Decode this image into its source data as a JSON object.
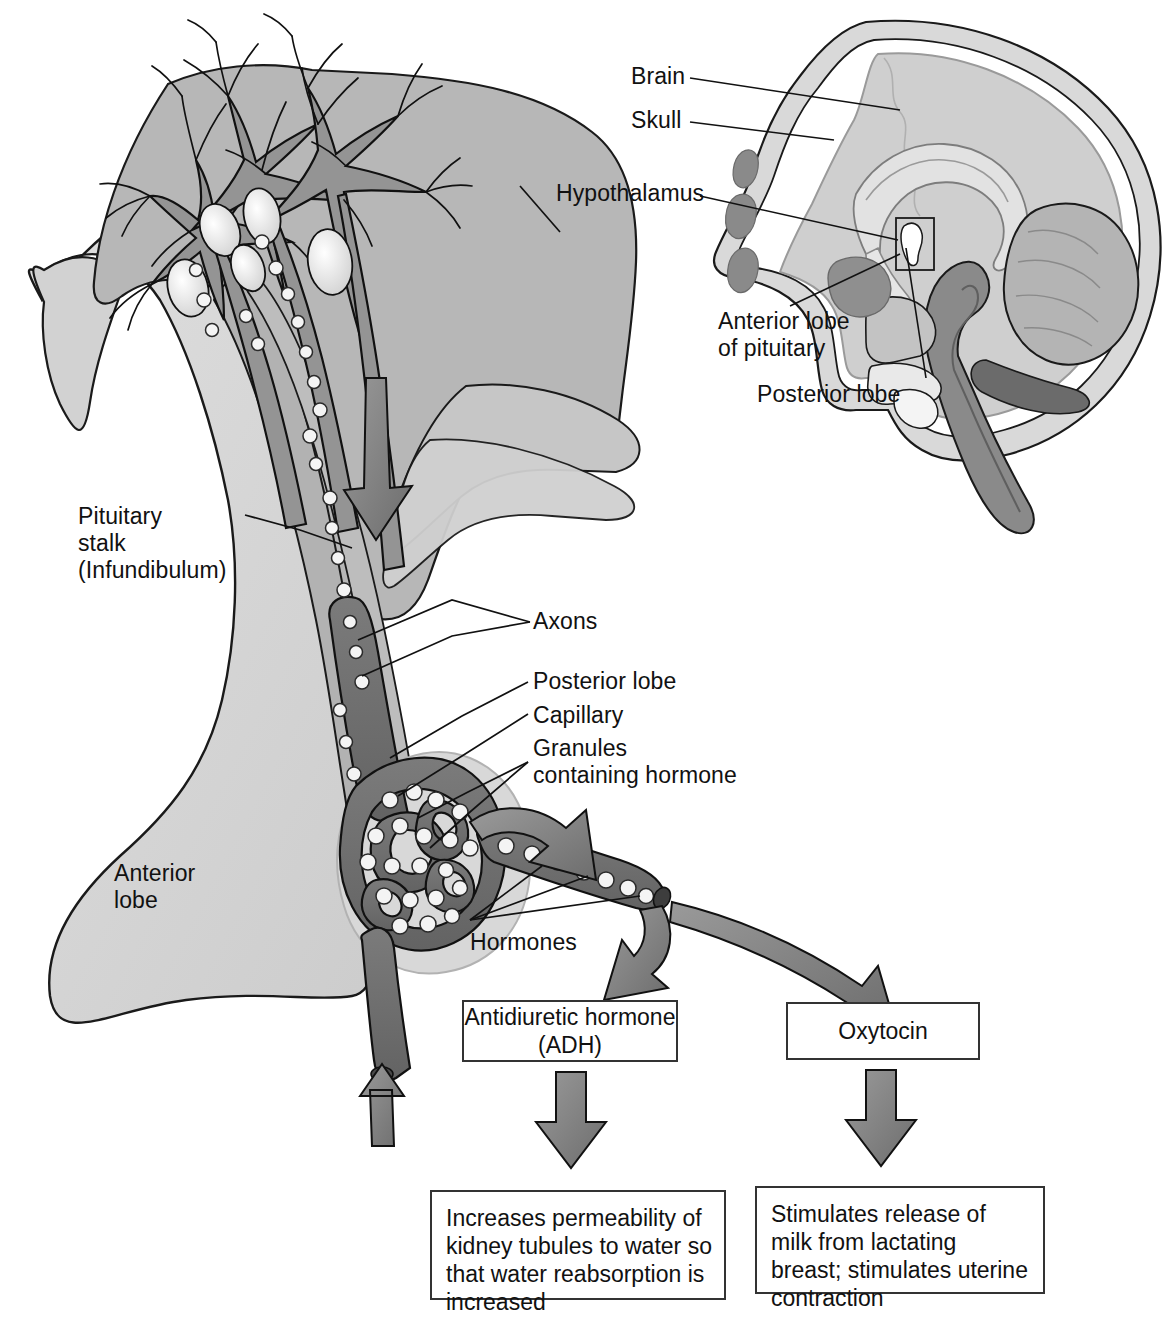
{
  "figure": {
    "type": "anatomical-diagram"
  },
  "inset": {
    "name": "midsagittal-head-section",
    "labels": [
      {
        "id": "brain",
        "text": "Brain"
      },
      {
        "id": "skull",
        "text": "Skull"
      },
      {
        "id": "hypothalamus",
        "text": "Hypothalamus"
      },
      {
        "id": "anterior-lobe",
        "text": "Anterior lobe\nof pituitary"
      },
      {
        "id": "posterior-lobe",
        "text": "Posterior lobe"
      }
    ]
  },
  "main": {
    "name": "posterior-pituitary-detail",
    "labels": [
      {
        "id": "pituitary-stalk",
        "text": "Pituitary\nstalk\n(Infundibulum)"
      },
      {
        "id": "axons",
        "text": "Axons"
      },
      {
        "id": "posterior-lobe",
        "text": "Posterior lobe"
      },
      {
        "id": "capillary",
        "text": "Capillary"
      },
      {
        "id": "granules",
        "text": "Granules\ncontaining hormone"
      },
      {
        "id": "anterior-lobe",
        "text": "Anterior\nlobe"
      },
      {
        "id": "hormones",
        "text": "Hormones"
      }
    ]
  },
  "hormone_boxes": [
    {
      "id": "adh",
      "label": "Antidiuretic\nhormone (ADH)"
    },
    {
      "id": "oxytocin",
      "label": "Oxytocin"
    }
  ],
  "effect_boxes": [
    {
      "id": "adh-effect",
      "label": "Increases permeability of\nkidney tubules to water\nso that water reabsorption\nis increased"
    },
    {
      "id": "oxytocin-effect",
      "label": "Stimulates release of milk\nfrom lactating breast;\nstimulates uterine\ncontraction"
    }
  ],
  "colors": {
    "hypothalamus_fill": "#b7b7b7",
    "neuron_fill": "#949494",
    "nucleus_fill": "#e2e2e2",
    "anterior_lobe_fill": "#d6d6d6",
    "axon_tract_fill": "#b2b2b2",
    "capillary_fill": "#6e6e6e",
    "granule_fill": "#f2f2f2",
    "arrow_fill": "#787878",
    "brain_fill": "#cfcfcf",
    "skull_fill": "#d9d9d9",
    "dark_tissue_fill": "#8a8a8a",
    "darker_tissue_fill": "#6b6b6b",
    "outline": "#1a1a1a",
    "box_border": "#333333",
    "page_background": "#ffffff"
  }
}
